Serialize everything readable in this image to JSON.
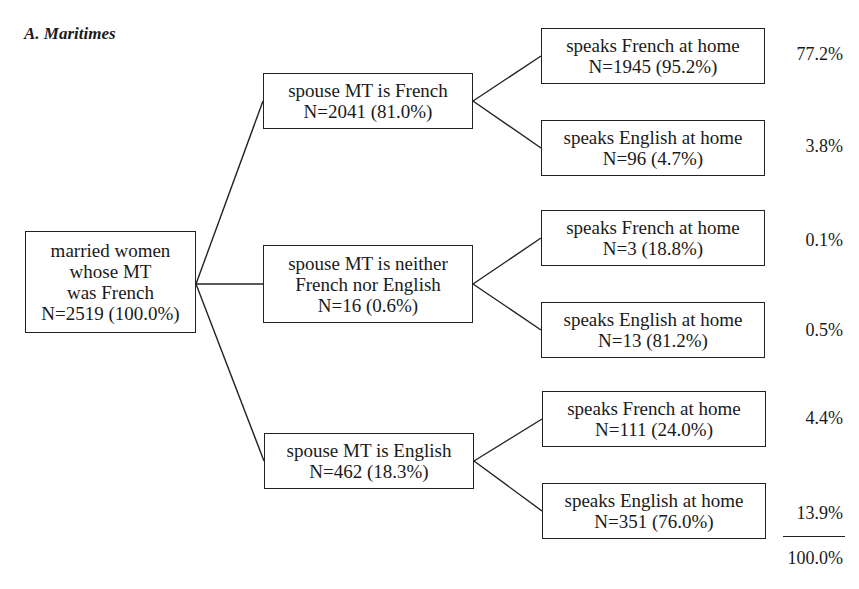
{
  "title": "A. Maritimes",
  "root": {
    "lines": [
      "married women",
      "whose MT",
      "was French",
      "N=2519 (100.0%)"
    ]
  },
  "level1": [
    {
      "lines": [
        "spouse MT is French",
        "N=2041 (81.0%)"
      ]
    },
    {
      "lines": [
        "spouse MT is neither",
        "French nor English",
        "N=16 (0.6%)"
      ]
    },
    {
      "lines": [
        "spouse MT is English",
        "N=462 (18.3%)"
      ]
    }
  ],
  "level2": [
    {
      "lines": [
        "speaks French at home",
        "N=1945 (95.2%)"
      ],
      "share": "77.2%"
    },
    {
      "lines": [
        "speaks English at home",
        "N=96 (4.7%)"
      ],
      "share": "3.8%"
    },
    {
      "lines": [
        "speaks French at home",
        "N=3 (18.8%)"
      ],
      "share": "0.1%"
    },
    {
      "lines": [
        "speaks English at home",
        "N=13 (81.2%)"
      ],
      "share": "0.5%"
    },
    {
      "lines": [
        "speaks French at home",
        "N=111 (24.0%)"
      ],
      "share": "4.4%"
    },
    {
      "lines": [
        "speaks English at home",
        "N=351 (76.0%)"
      ],
      "share": "13.9%"
    }
  ],
  "total": "100.0%",
  "colors": {
    "line": "#222222",
    "text": "#1a1a1a",
    "background": "#ffffff"
  }
}
